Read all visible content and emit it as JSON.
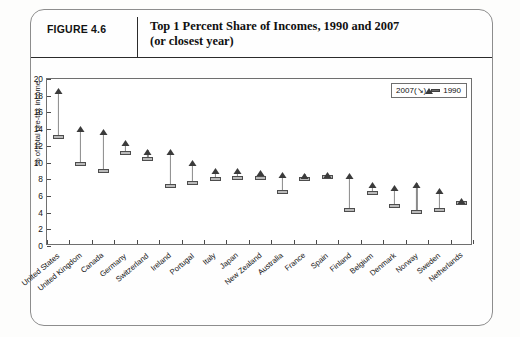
{
  "figure": {
    "label": "FIGURE 4.6",
    "title_line1": "Top 1 Percent Share of Incomes, 1990 and 2007",
    "title_line2": "(or closest year)"
  },
  "legend": {
    "position": "top-right",
    "items": [
      {
        "marker": "triangle-up-icon",
        "label": "2007(↘)"
      },
      {
        "marker": "dash-icon",
        "label": "1990"
      }
    ]
  },
  "chart_data": {
    "type": "scatter",
    "title": "Top 1 Percent Share of Incomes, 1990 and 2007 (or closest year)",
    "xlabel": "",
    "ylabel": "% of total pre-tax income",
    "ylim": [
      0,
      20
    ],
    "yticks": [
      0,
      2,
      4,
      6,
      8,
      10,
      12,
      14,
      16,
      18,
      20
    ],
    "grid": false,
    "legend_position": "top-right",
    "categories": [
      "United States",
      "United Kingdom",
      "Canada",
      "Germany",
      "Switzerland",
      "Ireland",
      "Portugal",
      "Italy",
      "Japan",
      "New Zealand",
      "Australia",
      "France",
      "Spain",
      "Finland",
      "Belgium",
      "Denmark",
      "Norway",
      "Sweden",
      "Netherlands"
    ],
    "series": [
      {
        "name": "2007(↘)",
        "marker": "triangle-up-icon",
        "values": [
          18.8,
          14.3,
          13.9,
          12.6,
          11.5,
          11.5,
          10.2,
          9.2,
          9.2,
          9.0,
          8.8,
          8.6,
          8.8,
          8.6,
          7.6,
          7.2,
          7.6,
          6.8,
          5.6
        ]
      },
      {
        "name": "1990",
        "marker": "dash-icon",
        "values": [
          13.0,
          9.8,
          9.0,
          11.1,
          10.4,
          7.2,
          7.5,
          8.0,
          8.1,
          8.2,
          6.5,
          8.0,
          8.3,
          4.3,
          6.3,
          4.8,
          4.1,
          4.3,
          5.2
        ]
      }
    ]
  }
}
